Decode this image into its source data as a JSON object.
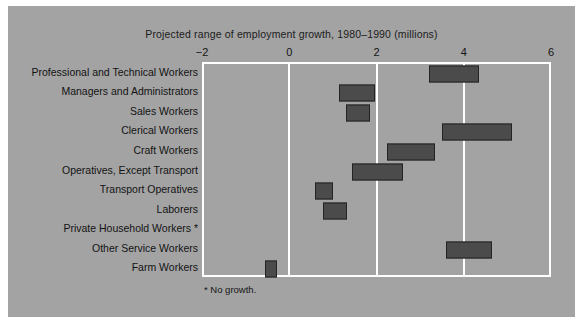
{
  "figure": {
    "background_color": "#a3a3a3",
    "plot_background_color": "#a3a3a3",
    "gridline_color": "#ffffff",
    "bar_color": "#4b4b4b",
    "bar_border_color": "#232323",
    "footnote": "* No growth."
  },
  "chart_data": {
    "type": "bar",
    "orientation": "horizontal",
    "subtype": "range-bar",
    "title": "Projected range of employment growth, 1980–1990 (millions)",
    "xlabel": "",
    "ylabel": "",
    "xlim": [
      -2,
      6
    ],
    "xticks": [
      -2,
      0,
      2,
      4,
      6
    ],
    "xticklabels": [
      "−2",
      "0",
      "2",
      "4",
      "6"
    ],
    "grid": true,
    "grid_axis": "x",
    "legend": false,
    "units": "millions",
    "categories": [
      "Professional and Technical Workers",
      "Managers and Administrators",
      "Sales Workers",
      "Clerical Workers",
      "Craft Workers",
      "Operatives, Except Transport",
      "Transport Operatives",
      "Laborers",
      "Private Household Workers *",
      "Other Service Workers",
      "Farm Workers"
    ],
    "ranges": [
      {
        "category": "Professional and Technical Workers",
        "low": 3.2,
        "high": 4.35
      },
      {
        "category": "Managers and Administrators",
        "low": 1.15,
        "high": 1.97
      },
      {
        "category": "Sales Workers",
        "low": 1.3,
        "high": 1.85
      },
      {
        "category": "Clerical Workers",
        "low": 3.5,
        "high": 5.1
      },
      {
        "category": "Craft Workers",
        "low": 2.25,
        "high": 3.35
      },
      {
        "category": "Operatives, Except Transport",
        "low": 1.43,
        "high": 2.6
      },
      {
        "category": "Transport Operatives",
        "low": 0.6,
        "high": 1.0
      },
      {
        "category": "Laborers",
        "low": 0.77,
        "high": 1.32
      },
      {
        "category": "Private Household Workers *",
        "low": null,
        "high": null
      },
      {
        "category": "Other Service Workers",
        "low": 3.6,
        "high": 4.65
      },
      {
        "category": "Farm Workers",
        "low": -0.55,
        "high": -0.27
      }
    ],
    "annotations": [
      "* No growth."
    ]
  }
}
